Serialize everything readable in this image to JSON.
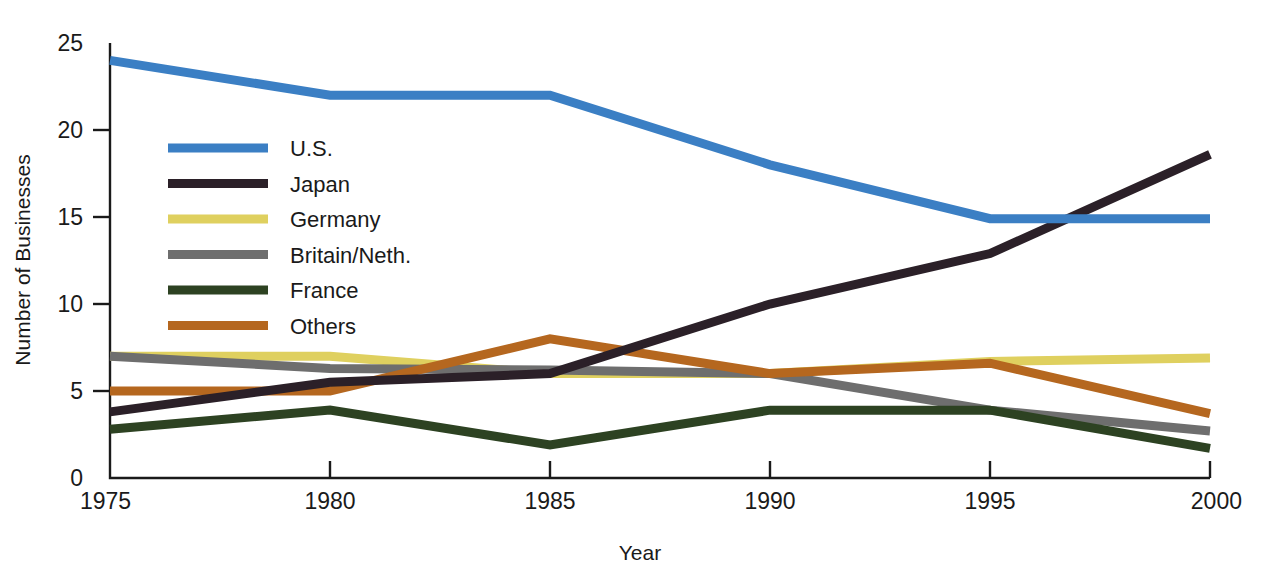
{
  "chart_data": {
    "type": "line",
    "title": "",
    "xlabel": "Year",
    "ylabel": "Number of Businesses",
    "x": [
      1975,
      1980,
      1985,
      1990,
      1995,
      2000
    ],
    "xticklabels": [
      "1975",
      "1980",
      "1985",
      "1990",
      "1995",
      "2000"
    ],
    "yticklabels": [
      "0",
      "5",
      "10",
      "15",
      "20",
      "25"
    ],
    "yticks": [
      0,
      5,
      10,
      15,
      20,
      25
    ],
    "xlim": [
      1975,
      2000
    ],
    "ylim": [
      0,
      25
    ],
    "grid": false,
    "legend_position": "upper-left-inside",
    "series": [
      {
        "name": "U.S.",
        "color": "#3B7FC4",
        "values": [
          24.0,
          22.0,
          22.0,
          18.0,
          14.9,
          14.9
        ]
      },
      {
        "name": "Japan",
        "color": "#2B2028",
        "values": [
          3.8,
          5.5,
          6.0,
          10.0,
          12.9,
          18.6
        ]
      },
      {
        "name": "Germany",
        "color": "#DFD05F",
        "values": [
          7.0,
          7.0,
          6.0,
          6.0,
          6.7,
          6.9
        ]
      },
      {
        "name": "Britain/Neth.",
        "color": "#6E6E6E",
        "values": [
          7.0,
          6.3,
          6.2,
          6.0,
          3.9,
          2.7
        ]
      },
      {
        "name": "France",
        "color": "#2D4222",
        "values": [
          2.8,
          3.9,
          1.9,
          3.9,
          3.9,
          1.7
        ]
      },
      {
        "name": "Others",
        "color": "#B5671F",
        "values": [
          5.0,
          5.0,
          8.0,
          6.0,
          6.6,
          3.7
        ]
      }
    ]
  },
  "axes": {
    "x_title": "Year",
    "y_title": "Number of Businesses"
  },
  "legend": {
    "entries": [
      {
        "label": "U.S.",
        "color": "#3B7FC4"
      },
      {
        "label": "Japan",
        "color": "#2B2028"
      },
      {
        "label": "Germany",
        "color": "#DFD05F"
      },
      {
        "label": "Britain/Neth.",
        "color": "#6E6E6E"
      },
      {
        "label": "France",
        "color": "#2D4222"
      },
      {
        "label": "Others",
        "color": "#B5671F"
      }
    ]
  }
}
